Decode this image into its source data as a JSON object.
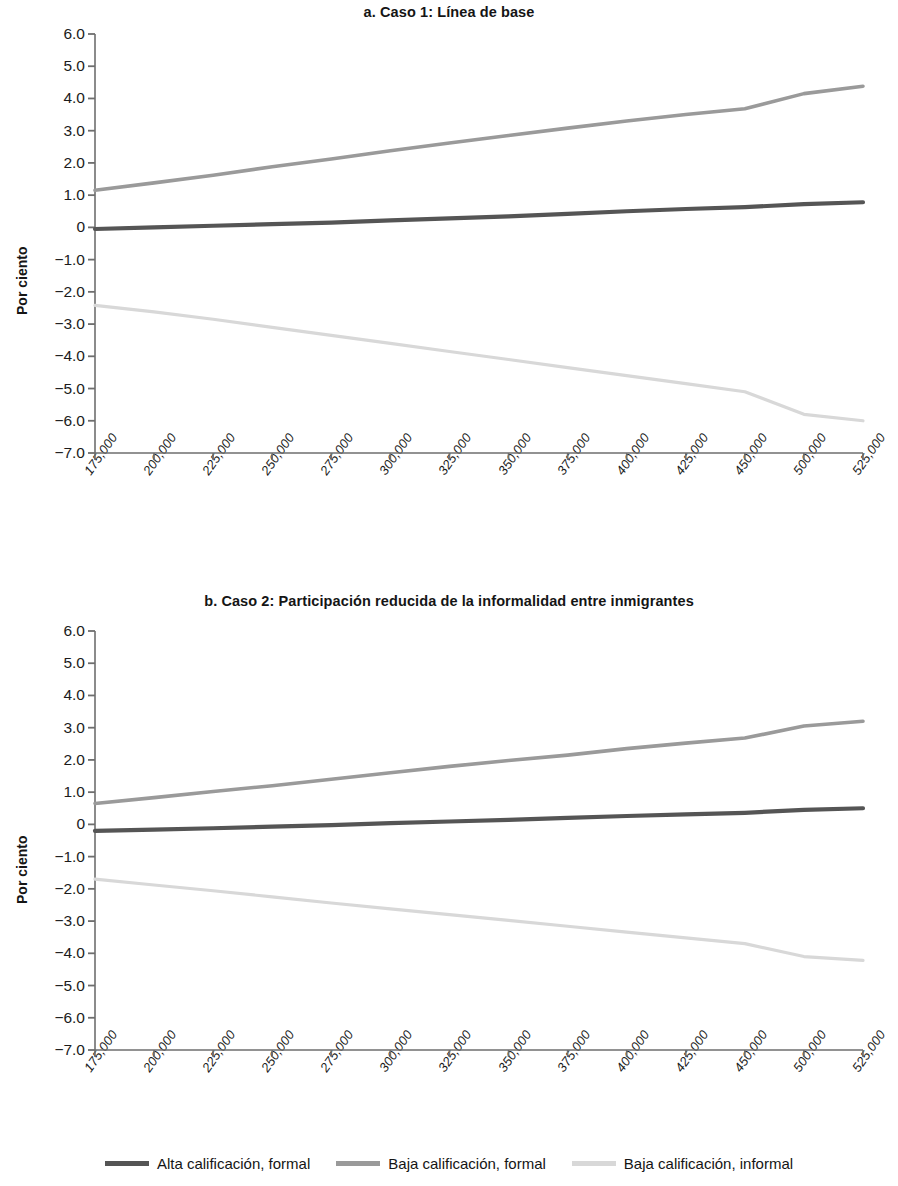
{
  "figure": {
    "ylabel": "Por ciento",
    "legend_position": "bottom-center"
  },
  "series_colors": {
    "alta_formal": "#555555",
    "baja_formal": "#9a9a9a",
    "baja_informal": "#d8d8d8"
  },
  "legend": {
    "items": [
      {
        "label": "Alta calificación, formal",
        "color": "#555555"
      },
      {
        "label": "Baja calificación, formal",
        "color": "#9a9a9a"
      },
      {
        "label": "Baja calificación, informal",
        "color": "#d8d8d8"
      }
    ]
  },
  "panels": [
    {
      "key": "a",
      "title": "a. Caso 1:  Línea de base"
    },
    {
      "key": "b",
      "title": "b. Caso 2:  Participación reducida de la informalidad entre inmigrantes"
    }
  ],
  "chart_data": [
    {
      "type": "line",
      "title": "a. Caso 1:  Línea de base",
      "xlabel": "",
      "ylabel": "Por ciento",
      "grid": false,
      "legend_position": "bottom",
      "ylim": [
        -7.0,
        6.0
      ],
      "yticks": [
        "6.0",
        "5.0",
        "4.0",
        "3.0",
        "2.0",
        "1.0",
        "0",
        "-1.0",
        "-2.0",
        "-3.0",
        "-4.0",
        "-5.0",
        "-6.0",
        "-7.0"
      ],
      "ytick_values": [
        6.0,
        5.0,
        4.0,
        3.0,
        2.0,
        1.0,
        0,
        -1.0,
        -2.0,
        -3.0,
        -4.0,
        -5.0,
        -6.0,
        -7.0
      ],
      "categories": [
        "175,000",
        "200,000",
        "225,000",
        "250,000",
        "275,000",
        "300,000",
        "325,000",
        "350,000",
        "375,000",
        "400,000",
        "425,000",
        "450,000",
        "500,000",
        "525,000"
      ],
      "series": [
        {
          "name": "Alta calificación, formal",
          "color": "#555555",
          "values": [
            -0.05,
            0.0,
            0.05,
            0.1,
            0.15,
            0.22,
            0.28,
            0.34,
            0.42,
            0.5,
            0.57,
            0.63,
            0.72,
            0.78
          ]
        },
        {
          "name": "Baja calificación, formal",
          "color": "#9a9a9a",
          "values": [
            1.15,
            1.38,
            1.62,
            1.88,
            2.12,
            2.38,
            2.62,
            2.85,
            3.08,
            3.3,
            3.5,
            3.68,
            4.15,
            4.38
          ]
        },
        {
          "name": "Baja calificación, informal",
          "color": "#d8d8d8",
          "values": [
            -2.42,
            -2.62,
            -2.85,
            -3.1,
            -3.35,
            -3.6,
            -3.85,
            -4.1,
            -4.35,
            -4.6,
            -4.85,
            -5.1,
            -5.8,
            -6.0
          ]
        }
      ]
    },
    {
      "type": "line",
      "title": "b. Caso 2:  Participación reducida de la informalidad entre inmigrantes",
      "xlabel": "",
      "ylabel": "Por ciento",
      "grid": false,
      "legend_position": "bottom",
      "ylim": [
        -7.0,
        6.0
      ],
      "yticks": [
        "6.0",
        "5.0",
        "4.0",
        "3.0",
        "2.0",
        "1.0",
        "0",
        "-1.0",
        "-2.0",
        "-3.0",
        "-4.0",
        "-5.0",
        "-6.0",
        "-7.0"
      ],
      "ytick_values": [
        6.0,
        5.0,
        4.0,
        3.0,
        2.0,
        1.0,
        0,
        -1.0,
        -2.0,
        -3.0,
        -4.0,
        -5.0,
        -6.0,
        -7.0
      ],
      "categories": [
        "175,000",
        "200,000",
        "225,000",
        "250,000",
        "275,000",
        "300,000",
        "325,000",
        "350,000",
        "375,000",
        "400,000",
        "425,000",
        "450,000",
        "500,000",
        "525,000"
      ],
      "series": [
        {
          "name": "Alta calificación, formal",
          "color": "#555555",
          "values": [
            -0.2,
            -0.16,
            -0.12,
            -0.07,
            -0.02,
            0.04,
            0.09,
            0.14,
            0.2,
            0.26,
            0.31,
            0.36,
            0.45,
            0.5
          ]
        },
        {
          "name": "Baja calificación, formal",
          "color": "#9a9a9a",
          "values": [
            0.65,
            0.83,
            1.02,
            1.2,
            1.4,
            1.6,
            1.8,
            1.98,
            2.15,
            2.35,
            2.52,
            2.68,
            3.05,
            3.2
          ]
        },
        {
          "name": "Baja calificación, informal",
          "color": "#d8d8d8",
          "values": [
            -1.7,
            -1.88,
            -2.06,
            -2.25,
            -2.44,
            -2.62,
            -2.8,
            -2.98,
            -3.16,
            -3.34,
            -3.52,
            -3.7,
            -4.1,
            -4.22
          ]
        }
      ]
    }
  ]
}
